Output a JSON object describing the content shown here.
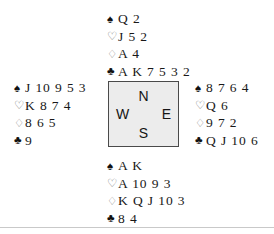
{
  "diagram": {
    "type": "bridge-deal",
    "suit_symbols": {
      "spade": "♠",
      "heart": "♡",
      "diamond": "♢",
      "club": "♣"
    },
    "compass": {
      "north": "N",
      "south": "S",
      "west": "W",
      "east": "E"
    },
    "colors": {
      "background": "#ffffff",
      "text": "#181818",
      "box_fill": "#ececec",
      "box_border": "#4a4a4a",
      "rule": "#c9c9c9"
    },
    "hands": {
      "north": {
        "spades": "Q 2",
        "hearts": "J 5 2",
        "diamonds": "A 4",
        "clubs": "A K 7 5 3 2"
      },
      "west": {
        "spades": "J 10 9 5 3",
        "hearts": "K 8 7 4",
        "diamonds": "8 6 5",
        "clubs": "9"
      },
      "east": {
        "spades": "8 7 6 4",
        "hearts": "Q 6",
        "diamonds": "9 7 2",
        "clubs": "Q J 10 6"
      },
      "south": {
        "spades": "A K",
        "hearts": "A 10 9 3",
        "diamonds": "K Q J 10 3",
        "clubs": "8 4"
      }
    }
  }
}
